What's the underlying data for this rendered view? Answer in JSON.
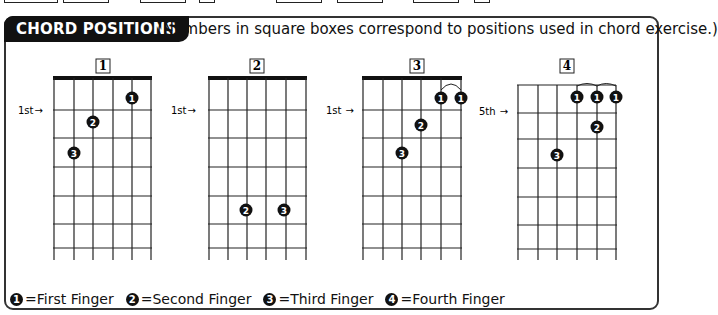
{
  "header": {
    "title": "CHORD POSITIONS",
    "subtitle": "(Numbers in square boxes correspond to positions used in chord exercise.)"
  },
  "diagrams": [
    {
      "number": "1",
      "position_label": "1st",
      "nut": true,
      "fingers": [
        {
          "finger": "1",
          "string": 5,
          "fret": 1
        },
        {
          "finger": "2",
          "string": 3,
          "fret": 2
        },
        {
          "finger": "3",
          "string": 2,
          "fret": 3
        }
      ]
    },
    {
      "number": "2",
      "position_label": "1st",
      "nut": true,
      "fingers": [
        {
          "finger": "2",
          "string": 3,
          "fret": 5
        },
        {
          "finger": "3",
          "string": 5,
          "fret": 5
        }
      ]
    },
    {
      "number": "3",
      "position_label": "1st",
      "nut": true,
      "fingers": [
        {
          "finger": "1",
          "string": 5,
          "fret": 1
        },
        {
          "finger": "1",
          "string": 6,
          "fret": 1
        },
        {
          "finger": "2",
          "string": 4,
          "fret": 2
        },
        {
          "finger": "3",
          "string": 3,
          "fret": 3
        }
      ]
    },
    {
      "number": "4",
      "position_label": "5th",
      "nut": false,
      "fingers": [
        {
          "finger": "1",
          "string": 4,
          "fret": 1
        },
        {
          "finger": "1",
          "string": 5,
          "fret": 1
        },
        {
          "finger": "1",
          "string": 6,
          "fret": 1
        },
        {
          "finger": "2",
          "string": 5,
          "fret": 2
        },
        {
          "finger": "3",
          "string": 3,
          "fret": 3
        }
      ]
    }
  ],
  "legend": [
    {
      "symbol": "1",
      "label": "=First Finger"
    },
    {
      "symbol": "2",
      "label": "=Second Finger"
    },
    {
      "symbol": "3",
      "label": "=Third Finger"
    },
    {
      "symbol": "4",
      "label": "=Fourth Finger"
    }
  ],
  "labels": {
    "d1_num": "1",
    "d2_num": "2",
    "d3_num": "3",
    "d4_num": "4",
    "d1_pos": "1st",
    "d2_pos": "1st",
    "d3_pos": "1st",
    "d4_pos": "5th",
    "arrow": "→"
  }
}
